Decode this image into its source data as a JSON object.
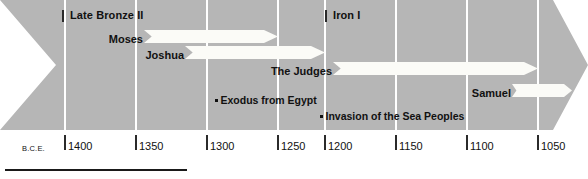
{
  "diagram": {
    "colors": {
      "banner": "#b6b6b6",
      "gridline": "#ffffff",
      "arrow": "#fbfbf7",
      "text": "#111111",
      "rule": "#1a1a1a"
    }
  },
  "axis": {
    "era_label": "B.C.E.",
    "ticks": [
      {
        "label": "1400",
        "x": 65
      },
      {
        "label": "1350",
        "x": 136
      },
      {
        "label": "1300",
        "x": 207
      },
      {
        "label": "1250",
        "x": 278
      },
      {
        "label": "1200",
        "x": 325
      },
      {
        "label": "1150",
        "x": 396
      },
      {
        "label": "1100",
        "x": 467
      },
      {
        "label": "1050",
        "x": 538
      }
    ]
  },
  "gridlines": [
    65,
    136,
    207,
    278,
    325,
    396,
    467,
    538
  ],
  "eras": [
    {
      "label": "Late Bronze II",
      "tick_x": 62,
      "label_x": 70,
      "y": 10
    },
    {
      "label": "Iron I",
      "tick_x": 325,
      "label_x": 333,
      "y": 10
    }
  ],
  "bands": [
    {
      "label": "Moses",
      "left": 144,
      "right": 278,
      "top": 30
    },
    {
      "label": "Joshua",
      "left": 185,
      "right": 325,
      "top": 46
    },
    {
      "label": "The Judges",
      "left": 333,
      "right": 538,
      "top": 62
    },
    {
      "label": "Samuel",
      "left": 512,
      "right": 572,
      "top": 84
    }
  ],
  "events": [
    {
      "label": "Exodus from Egypt",
      "x": 215,
      "y": 94
    },
    {
      "label": "Invasion of the Sea Peoples",
      "x": 320,
      "y": 110
    }
  ]
}
